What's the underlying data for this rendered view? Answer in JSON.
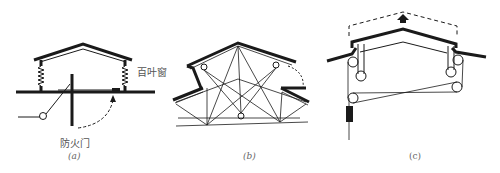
{
  "figures": [
    {
      "id": "a",
      "caption": "(a)",
      "labels": {
        "louver": "百叶窗",
        "fire_door": "防火门"
      },
      "description": "Gable roof vent on spring-loaded posts with louvers; pivoting fire door under opening, released via cable and pulley; dashed arrow shows door swing"
    },
    {
      "id": "b",
      "caption": "(b)",
      "description": "Truss-braced ridge vent with two hinged roof flaps, pivot circles and diagonal bracing; dashed arc shows flap opening"
    },
    {
      "id": "c",
      "caption": "(c)",
      "description": "Liftable ridge cap raised by pulley/cable system with counterweight; dashed outline and upward arrow show raised position"
    }
  ],
  "colors": {
    "ink": "#1a1a1a",
    "label": "#555555"
  }
}
